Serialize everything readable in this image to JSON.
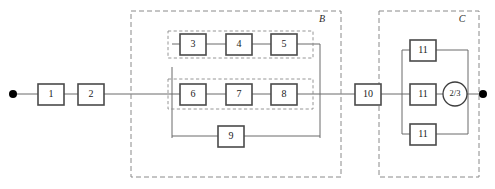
{
  "diagram": {
    "type": "reliability-block-diagram",
    "canvas": {
      "width": 495,
      "height": 189
    },
    "terminals": [
      {
        "name": "input-terminal",
        "x": 13,
        "y": 94
      },
      {
        "name": "output-terminal",
        "x": 483,
        "y": 94
      }
    ],
    "groups": [
      {
        "id": "B",
        "label": "B",
        "x": 131,
        "y": 11,
        "width": 210,
        "height": 166,
        "label_x": 322,
        "label_y": 20
      },
      {
        "id": "C",
        "label": "C",
        "x": 379,
        "y": 11,
        "width": 100,
        "height": 166,
        "label_x": 462,
        "label_y": 20
      }
    ],
    "subgroups": [
      {
        "id": "sub-top",
        "x": 168,
        "y": 31,
        "width": 145,
        "height": 27
      },
      {
        "id": "sub-mid",
        "x": 168,
        "y": 79,
        "width": 145,
        "height": 30
      }
    ],
    "blocks": [
      {
        "id": "b1",
        "label": "1",
        "x": 38,
        "y": 84,
        "width": 26,
        "height": 21
      },
      {
        "id": "b2",
        "label": "2",
        "x": 78,
        "y": 84,
        "width": 26,
        "height": 21
      },
      {
        "id": "b3",
        "label": "3",
        "x": 180,
        "y": 34,
        "width": 26,
        "height": 21
      },
      {
        "id": "b4",
        "label": "4",
        "x": 226,
        "y": 34,
        "width": 26,
        "height": 21
      },
      {
        "id": "b5",
        "label": "5",
        "x": 271,
        "y": 34,
        "width": 26,
        "height": 21
      },
      {
        "id": "b6",
        "label": "6",
        "x": 180,
        "y": 84,
        "width": 26,
        "height": 21
      },
      {
        "id": "b7",
        "label": "7",
        "x": 226,
        "y": 84,
        "width": 26,
        "height": 21
      },
      {
        "id": "b8",
        "label": "8",
        "x": 271,
        "y": 84,
        "width": 26,
        "height": 21
      },
      {
        "id": "b9",
        "label": "9",
        "x": 218,
        "y": 126,
        "width": 26,
        "height": 21
      },
      {
        "id": "b10",
        "label": "10",
        "x": 355,
        "y": 84,
        "width": 26,
        "height": 21
      },
      {
        "id": "b11a",
        "label": "11",
        "x": 410,
        "y": 40,
        "width": 26,
        "height": 21
      },
      {
        "id": "b11b",
        "label": "11",
        "x": 410,
        "y": 84,
        "width": 26,
        "height": 21
      },
      {
        "id": "b11c",
        "label": "11",
        "x": 410,
        "y": 124,
        "width": 26,
        "height": 21
      }
    ],
    "voter": {
      "id": "voter23",
      "label": "2/3",
      "cx": 455,
      "cy": 94,
      "r": 12
    },
    "wires": [
      {
        "id": "w-in-b1",
        "d": "M 13 94 L 38 94"
      },
      {
        "id": "w-b1-b2",
        "d": "M 64 94 L 78 94"
      },
      {
        "id": "w-b2-Bjunc",
        "d": "M 104 94 L 172 94"
      },
      {
        "id": "w-Bjunc-vert",
        "d": "M 172 67 L 172 138"
      },
      {
        "id": "w-top-branch-in",
        "d": "M 172 44 L 180 44"
      },
      {
        "id": "w-b3-b4",
        "d": "M 206 44 L 226 44"
      },
      {
        "id": "w-b4-b5",
        "d": "M 252 44 L 271 44"
      },
      {
        "id": "w-b5-right",
        "d": "M 297 44 L 320 44"
      },
      {
        "id": "w-right-vert",
        "d": "M 320 44 L 320 138"
      },
      {
        "id": "w-b6-in",
        "d": "M 172 94 L 180 94"
      },
      {
        "id": "w-b6-b7",
        "d": "M 206 94 L 226 94"
      },
      {
        "id": "w-b7-b8",
        "d": "M 252 94 L 271 94"
      },
      {
        "id": "w-b8-out",
        "d": "M 297 94 L 355 94"
      },
      {
        "id": "w-b9-in",
        "d": "M 172 136 L 218 136"
      },
      {
        "id": "w-b9-out",
        "d": "M 244 136 L 320 136"
      },
      {
        "id": "w-b10-Cjunc",
        "d": "M 381 94 L 402 94"
      },
      {
        "id": "w-C-left-vert",
        "d": "M 402 50 L 402 134"
      },
      {
        "id": "w-11a-in",
        "d": "M 402 50 L 410 50"
      },
      {
        "id": "w-11a-out",
        "d": "M 436 50 L 468 50"
      },
      {
        "id": "w-11b-in",
        "d": "M 402 94 L 410 94"
      },
      {
        "id": "w-11b-out",
        "d": "M 436 94 L 443 94"
      },
      {
        "id": "w-11c-in",
        "d": "M 402 134 L 410 134"
      },
      {
        "id": "w-11c-out",
        "d": "M 436 134 L 468 134"
      },
      {
        "id": "w-C-right-vert",
        "d": "M 468 50 L 468 134"
      },
      {
        "id": "w-voter-out",
        "d": "M 467 94 L 483 94"
      }
    ]
  }
}
